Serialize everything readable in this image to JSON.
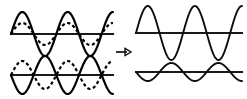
{
  "figure": {
    "background_color": "#ffffff",
    "stroke_color": "#000000",
    "width": 247,
    "height": 99
  },
  "arrow": {
    "name": "right-arrow",
    "glyph": "→",
    "x1": 116,
    "y1": 52,
    "x2": 131,
    "y2": 52
  },
  "chart_data": {
    "type": "line",
    "xlabel": "",
    "ylabel": "",
    "grid": false,
    "legend": "none",
    "panels": [
      {
        "id": "top-left",
        "name": "constructive-input-panel",
        "label": "In-phase component waves",
        "x_range": [
          11,
          113
        ],
        "baseline_y": 34,
        "series": [
          {
            "name": "component-wave-1",
            "style": "solid",
            "amplitude": 22,
            "cycles": 2.25,
            "phase_deg": 0,
            "stroke": "#000000"
          },
          {
            "name": "component-wave-2",
            "style": "dashed",
            "amplitude": 11,
            "cycles": 2.25,
            "phase_deg": 0,
            "stroke": "#000000"
          }
        ]
      },
      {
        "id": "bottom-left",
        "name": "destructive-input-panel",
        "label": "Anti-phase component waves",
        "x_range": [
          11,
          113
        ],
        "baseline_y": 75,
        "series": [
          {
            "name": "component-wave-3",
            "style": "solid",
            "amplitude": 19,
            "cycles": 2.25,
            "phase_deg": 180,
            "stroke": "#000000"
          },
          {
            "name": "component-wave-4",
            "style": "dashed",
            "amplitude": 14,
            "cycles": 2.25,
            "phase_deg": 0,
            "stroke": "#000000"
          }
        ]
      },
      {
        "id": "top-right",
        "name": "constructive-result-panel",
        "label": "Resultant wave, large amplitude",
        "x_range": [
          136,
          242
        ],
        "baseline_y": 33,
        "series": [
          {
            "name": "resultant-wave-large",
            "style": "solid",
            "amplitude": 27,
            "cycles": 2.25,
            "phase_deg": 0,
            "stroke": "#000000"
          }
        ]
      },
      {
        "id": "bottom-right",
        "name": "destructive-result-panel",
        "label": "Resultant wave, small amplitude",
        "x_range": [
          136,
          242
        ],
        "baseline_y": 72,
        "series": [
          {
            "name": "resultant-wave-small",
            "style": "solid",
            "amplitude": 9,
            "cycles": 2.25,
            "phase_deg": 180,
            "stroke": "#000000"
          }
        ]
      }
    ]
  }
}
